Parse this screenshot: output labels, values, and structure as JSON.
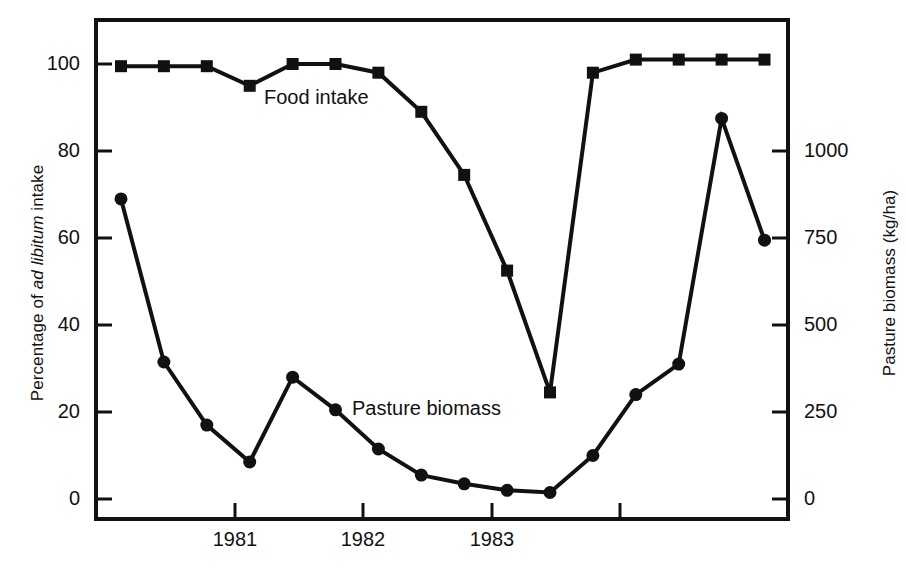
{
  "figure": {
    "background": "#ffffff",
    "ink_color": "#111111"
  },
  "axes": {
    "left": {
      "title_prefix": "Percentage of ",
      "title_italic": "ad libitum",
      "title_suffix": " intake",
      "title_full": "Percentage of ad libitum intake",
      "ticks": [
        "0",
        "20",
        "40",
        "60",
        "80",
        "100"
      ],
      "range": [
        0,
        100
      ]
    },
    "right": {
      "title": "Pasture biomass (kg/ha)",
      "ticks": [
        "0",
        "250",
        "500",
        "750",
        "1000"
      ],
      "range": [
        0,
        1000
      ]
    },
    "bottom": {
      "ticks": [
        "1981",
        "1982",
        "1983"
      ]
    }
  },
  "annotations": {
    "food_intake_label": "Food intake",
    "pasture_biomass_label": "Pasture biomass"
  },
  "chart_data": {
    "type": "line",
    "title": "",
    "xlabel": "",
    "ylabel": "Percentage of ad libitum intake",
    "y2label": "Pasture biomass (kg/ha)",
    "ylim": [
      0,
      100
    ],
    "y2lim": [
      0,
      1000
    ],
    "grid": false,
    "legend": "inline-annotations",
    "x_tick_labels": [
      "1981",
      "1982",
      "1983"
    ],
    "x_tick_positions": [
      4.0,
      8.0,
      12.0,
      16.0
    ],
    "x_label_positions": [
      6.0,
      10.0,
      14.0
    ],
    "x": [
      1,
      2,
      3,
      4,
      5,
      6,
      7,
      8,
      9,
      10,
      11,
      12,
      13,
      14,
      15,
      16
    ],
    "series": [
      {
        "name": "Food intake",
        "axis": "left",
        "unit": "% of ad libitum intake",
        "marker": "square",
        "values": [
          99.5,
          99.5,
          99.5,
          95.0,
          100.0,
          100.0,
          98.0,
          89.0,
          74.5,
          52.5,
          24.5,
          98.0,
          101.0,
          101.0,
          101.0,
          101.0
        ]
      },
      {
        "name": "Pasture biomass",
        "axis": "right",
        "unit": "kg/ha",
        "marker": "circle",
        "values_percent_scale": [
          69.0,
          31.5,
          17.0,
          8.5,
          28.0,
          20.5,
          11.5,
          5.5,
          3.5,
          2.0,
          1.5,
          10.0,
          24.0,
          31.0,
          87.5,
          59.5
        ],
        "values": [
          830,
          380,
          205,
          100,
          335,
          245,
          140,
          65,
          40,
          25,
          18,
          120,
          290,
          375,
          1050,
          715
        ]
      }
    ]
  }
}
